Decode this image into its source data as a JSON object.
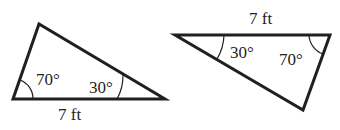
{
  "diagram": {
    "stroke_color": "#231f20",
    "background": "#ffffff",
    "triangles": [
      {
        "id": "left",
        "vertices": [
          [
            13,
            99
          ],
          [
            39,
            24
          ],
          [
            165,
            99
          ]
        ],
        "side_label": "7 ft",
        "angles": [
          {
            "label": "70°",
            "vertex": "bottom-left"
          },
          {
            "label": "30°",
            "vertex": "bottom-right"
          }
        ]
      },
      {
        "id": "right",
        "vertices": [
          [
            175,
            35
          ],
          [
            330,
            35
          ],
          [
            303,
            110
          ]
        ],
        "side_label": "7 ft",
        "angles": [
          {
            "label": "30°",
            "vertex": "top-left"
          },
          {
            "label": "70°",
            "vertex": "top-right"
          }
        ]
      }
    ]
  }
}
